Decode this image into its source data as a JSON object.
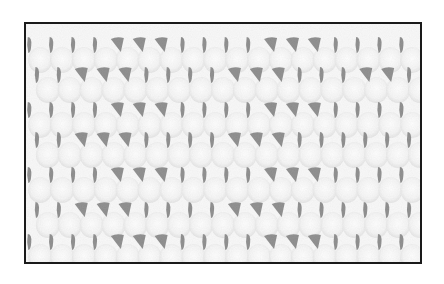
{
  "image": {
    "subject": "crochet stitch pattern swatch",
    "description": "Black-and-white photograph of a crocheted fabric swatch showing rows of stitches with open holes, enclosed in a thin dark border",
    "colors": {
      "background": "#ffffff",
      "border": "#1a1a1a",
      "yarn": "#f2f2f2",
      "yarn_shadow": "#c8c8c8",
      "holes": "#111111"
    },
    "rows": 7,
    "holes_per_row": 18,
    "row_y": [
      21,
      51,
      86,
      116,
      151,
      186,
      218
    ],
    "wide_hole_columns": {
      "0": [
        4,
        5,
        6,
        11,
        12,
        13
      ],
      "1": [
        2,
        3,
        4,
        9,
        10,
        11,
        15,
        16
      ],
      "2": [
        4,
        5,
        6,
        11,
        12,
        13
      ],
      "3": [
        2,
        3,
        4,
        9,
        10,
        11
      ],
      "4": [
        4,
        5,
        6,
        11,
        12,
        13
      ],
      "5": [
        2,
        3,
        4,
        9,
        10,
        11
      ],
      "6": [
        4,
        5,
        6,
        11,
        12,
        13
      ]
    }
  }
}
